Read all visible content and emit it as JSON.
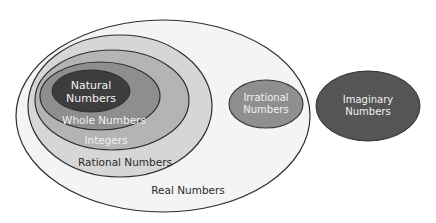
{
  "diagram": {
    "type": "venn-nested-sets",
    "sets": {
      "real": {
        "label": "Real Numbers",
        "fill": "#f4f4f4",
        "stroke": "#2e2e2e",
        "text_color": "#2b2b2b"
      },
      "rational": {
        "label": "Rational Numbers",
        "fill": "#d6d6d6",
        "stroke": "#2e2e2e",
        "text_color": "#2b2b2b"
      },
      "integers": {
        "label": "Integers",
        "fill": "#b4b4b4",
        "stroke": "#2e2e2e",
        "text_color": "#f2f2f2"
      },
      "whole": {
        "label": "Whole Numbers",
        "fill": "#8e8e8e",
        "stroke": "#2e2e2e",
        "text_color": "#f2f2f2"
      },
      "natural": {
        "label_line1": "Natural",
        "label_line2": "Numbers",
        "fill": "#3d3d3d",
        "stroke": "#2e2e2e",
        "text_color": "#f2f2f2"
      },
      "irrational": {
        "label_line1": "Irrational",
        "label_line2": "Numbers",
        "fill": "#8f8f8f",
        "stroke": "#3a3a3a",
        "text_color": "#f2f2f2"
      },
      "imaginary": {
        "label_line1": "Imaginary",
        "label_line2": "Numbers",
        "fill": "#555555",
        "stroke": "#2e2e2e",
        "text_color": "#f2f2f2"
      }
    }
  }
}
